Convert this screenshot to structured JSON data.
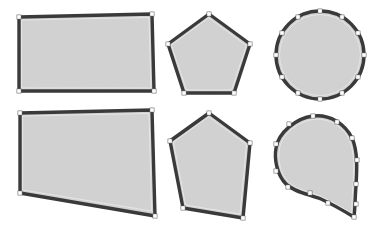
{
  "figure": {
    "background_color": "#ffffff",
    "canvas": {
      "width": 376,
      "height": 230
    },
    "style": {
      "fill_color": "#d2d2d2",
      "fill_texture": "noise",
      "outline_color": "#3a3a3a",
      "outline_highlight_color": "#e8e8e8",
      "outline_width": 3.4,
      "handle_fill_color": "#ffffff",
      "handle_stroke_color": "#4a4a4a",
      "handle_size": 2.1
    },
    "rows": [
      {
        "name": "original-row",
        "label": "Original shapes",
        "index": 0
      },
      {
        "name": "deformed-row",
        "label": "Deformed shapes",
        "index": 1
      }
    ],
    "shapes": [
      {
        "id": "rectangle-original",
        "name": "rectangle-original",
        "label": "Rectangle",
        "state": "original",
        "row": 0,
        "column": 0,
        "type": "polygon",
        "vertices": [
          [
            19,
            17
          ],
          [
            152,
            14
          ],
          [
            154,
            91
          ],
          [
            19,
            91
          ]
        ],
        "handles": [
          [
            19,
            17
          ],
          [
            152,
            14
          ],
          [
            154,
            91
          ],
          [
            19,
            91
          ]
        ]
      },
      {
        "id": "pentagon-original",
        "name": "pentagon-original",
        "label": "Pentagon",
        "state": "original",
        "row": 0,
        "column": 1,
        "type": "polygon",
        "vertices": [
          [
            209,
            14
          ],
          [
            250,
            44
          ],
          [
            234,
            93
          ],
          [
            184,
            93
          ],
          [
            168,
            44
          ]
        ],
        "handles": [
          [
            209,
            14
          ],
          [
            250,
            44
          ],
          [
            234,
            93
          ],
          [
            184,
            93
          ],
          [
            168,
            44
          ]
        ]
      },
      {
        "id": "circle-original",
        "name": "circle-original",
        "label": "Circle",
        "state": "original",
        "row": 0,
        "column": 2,
        "type": "closed-bezier",
        "center": [
          320,
          55
        ],
        "radius": 44,
        "handle_count": 12,
        "handles": [
          [
            320,
            11
          ],
          [
            342,
            17
          ],
          [
            358,
            33
          ],
          [
            364,
            55
          ],
          [
            358,
            77
          ],
          [
            342,
            93
          ],
          [
            320,
            99
          ],
          [
            298,
            93
          ],
          [
            282,
            77
          ],
          [
            276,
            55
          ],
          [
            282,
            33
          ],
          [
            298,
            17
          ]
        ]
      },
      {
        "id": "rectangle-deformed",
        "name": "rectangle-deformed",
        "label": "Rectangle",
        "state": "deformed",
        "row": 1,
        "column": 0,
        "type": "polygon",
        "vertices": [
          [
            20,
            113
          ],
          [
            152,
            110
          ],
          [
            155,
            216
          ],
          [
            20,
            193
          ]
        ],
        "handles": [
          [
            20,
            113
          ],
          [
            152,
            110
          ],
          [
            155,
            216
          ],
          [
            20,
            193
          ]
        ]
      },
      {
        "id": "pentagon-deformed",
        "name": "pentagon-deformed",
        "label": "Pentagon",
        "state": "deformed",
        "row": 1,
        "column": 1,
        "type": "polygon",
        "vertices": [
          [
            209,
            113
          ],
          [
            250,
            143
          ],
          [
            243,
            218
          ],
          [
            183,
            208
          ],
          [
            170,
            141
          ]
        ],
        "handles": [
          [
            209,
            113
          ],
          [
            250,
            143
          ],
          [
            243,
            218
          ],
          [
            183,
            208
          ],
          [
            170,
            141
          ]
        ]
      },
      {
        "id": "circle-deformed",
        "name": "circle-deformed",
        "label": "Circle",
        "state": "deformed",
        "row": 1,
        "column": 2,
        "type": "closed-bezier",
        "description": "teardrop with point pulled to lower right",
        "handle_count": 12,
        "handles": [
          [
            313,
            116
          ],
          [
            338,
            122
          ],
          [
            352,
            138
          ],
          [
            357,
            160
          ],
          [
            356,
            184
          ],
          [
            356,
            204
          ],
          [
            354,
            217
          ],
          [
            328,
            202
          ],
          [
            310,
            192
          ],
          [
            288,
            186
          ],
          [
            275,
            170
          ],
          [
            275,
            143
          ],
          [
            289,
            124
          ]
        ]
      }
    ]
  }
}
